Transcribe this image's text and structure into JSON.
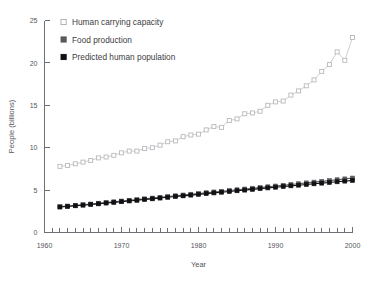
{
  "chart_data": {
    "type": "scatter",
    "title": "",
    "xlabel": "Year",
    "ylabel": "People (billions)",
    "xlim": [
      1960,
      2000
    ],
    "ylim": [
      0,
      25
    ],
    "xticks": [
      1960,
      1970,
      1980,
      1990,
      2000
    ],
    "xtick_labels": [
      "1960",
      "1970",
      "1980",
      "1990",
      "2000"
    ],
    "yticks": [
      0,
      5,
      10,
      15,
      20,
      25
    ],
    "ytick_labels": [
      "0",
      "5",
      "10",
      "15",
      "20",
      "25"
    ],
    "minor_xtick_interval": 1,
    "grid": false,
    "legend_position": "top-left",
    "x": [
      1962,
      1963,
      1964,
      1965,
      1966,
      1967,
      1968,
      1969,
      1970,
      1971,
      1972,
      1973,
      1974,
      1975,
      1976,
      1977,
      1978,
      1979,
      1980,
      1981,
      1982,
      1983,
      1984,
      1985,
      1986,
      1987,
      1988,
      1989,
      1990,
      1991,
      1992,
      1993,
      1994,
      1995,
      1996,
      1997,
      1998,
      1999,
      2000
    ],
    "series": [
      {
        "name": "Human carrying capacity",
        "marker": "open-square",
        "color": "#b9b9bd",
        "values": [
          7.8,
          7.9,
          8.1,
          8.3,
          8.5,
          8.8,
          8.9,
          9.1,
          9.4,
          9.6,
          9.6,
          9.9,
          10.0,
          10.3,
          10.7,
          10.8,
          11.3,
          11.5,
          11.6,
          12.1,
          12.5,
          12.4,
          13.2,
          13.4,
          14.0,
          14.1,
          14.3,
          15.0,
          15.4,
          15.5,
          16.2,
          16.7,
          17.3,
          18.0,
          19.0,
          19.8,
          21.3,
          20.3,
          23.0
        ]
      },
      {
        "name": "Food production",
        "marker": "filled-square",
        "color": "#5a5a5e",
        "values": [
          3.05,
          3.12,
          3.2,
          3.28,
          3.36,
          3.45,
          3.54,
          3.62,
          3.71,
          3.8,
          3.88,
          3.97,
          4.06,
          4.15,
          4.24,
          4.33,
          4.42,
          4.51,
          4.6,
          4.69,
          4.78,
          4.86,
          4.95,
          5.04,
          5.13,
          5.22,
          5.3,
          5.39,
          5.48,
          5.57,
          5.66,
          5.75,
          5.85,
          5.94,
          6.03,
          6.12,
          6.22,
          6.32,
          6.42
        ]
      },
      {
        "name": "Predicted human population",
        "marker": "filled-square",
        "color": "#111114",
        "values": [
          3.0,
          3.07,
          3.15,
          3.22,
          3.3,
          3.38,
          3.47,
          3.55,
          3.63,
          3.72,
          3.8,
          3.89,
          3.97,
          4.06,
          4.15,
          4.24,
          4.32,
          4.41,
          4.5,
          4.58,
          4.67,
          4.75,
          4.84,
          4.92,
          5.0,
          5.09,
          5.17,
          5.26,
          5.34,
          5.42,
          5.5,
          5.58,
          5.66,
          5.74,
          5.82,
          5.9,
          5.98,
          6.06,
          6.14
        ]
      }
    ]
  },
  "legend": {
    "items": [
      {
        "label": "Human carrying capacity",
        "marker": "open-square-marker"
      },
      {
        "label": "Food production",
        "marker": "gray-square-marker"
      },
      {
        "label": "Predicted human population",
        "marker": "black-square-marker"
      }
    ]
  },
  "axes": {
    "x_title": "Year",
    "y_title": "People (billions)"
  }
}
